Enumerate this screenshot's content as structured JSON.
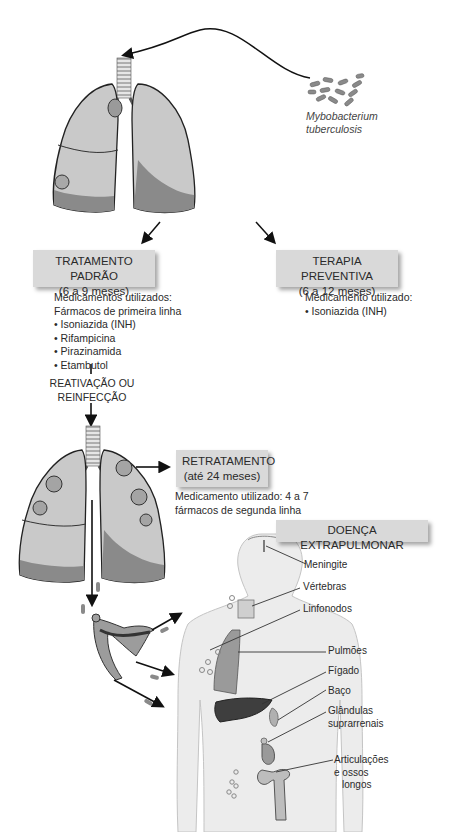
{
  "organism": {
    "line1": "Mybobacterium",
    "line2": "tuberculosis"
  },
  "standard_treatment": {
    "title": "TRATAMENTO PADRÃO",
    "duration": "(6 a 9 meses)",
    "meds_header": "Medicamentos utilizados:",
    "meds_subheader": "Fármacos de primeira linha",
    "drugs": [
      "• Isoniazida (INH)",
      "• Rifampicina",
      "• Pirazinamida",
      "• Etambutol"
    ]
  },
  "preventive_therapy": {
    "title": "TERAPIA PREVENTIVA",
    "duration": "(6 a 12 meses)",
    "meds_header": "Medicamento utilizado:",
    "drugs": [
      "• Isoniazida (INH)"
    ]
  },
  "reactivation": {
    "line1": "REATIVAÇÃO OU",
    "line2": "REINFECÇÃO"
  },
  "retreatment": {
    "title": "RETRATAMENTO",
    "duration": "(até 24 meses)",
    "meds_line1": "Medicamento utilizado: 4 a 7",
    "meds_line2": "fármacos de segunda linha"
  },
  "extrapulmonary": {
    "title": "DOENÇA EXTRAPULMONAR",
    "sites": {
      "meningite": "Meningite",
      "vertebras": "Vértebras",
      "linfonodos": "Linfonodos",
      "pulmoes": "Pulmões",
      "figado": "Fígado",
      "baco": "Baço",
      "glandulas_1": "Glândulas",
      "glandulas_2": "suprarrenais",
      "articulacoes_1": "Articulações",
      "articulacoes_2": "e ossos",
      "articulacoes_3": "longos"
    }
  },
  "colors": {
    "box_fill": "#d9d9d9",
    "lung_light": "#c8c8c8",
    "lung_dark": "#8a8a8a",
    "outline": "#222222",
    "body_fill": "#ededed",
    "liver": "#3e3e3e"
  }
}
